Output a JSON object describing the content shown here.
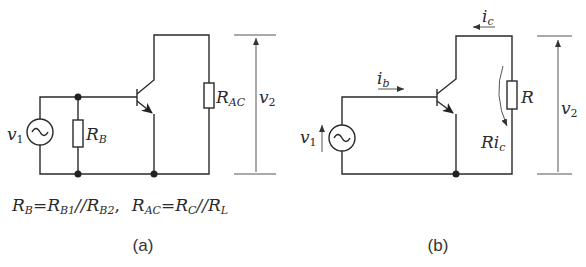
{
  "panel_a": {
    "caption": "(a)",
    "source_label": "v",
    "source_sub": "1",
    "rb_label": "R",
    "rb_sub": "B",
    "rac_label": "R",
    "rac_sub": "AC",
    "output_label": "v",
    "output_sub": "2",
    "formula": {
      "rb": "R",
      "rb_sub": "B",
      "eq1": "=",
      "rb1": "R",
      "rb1_sub": "B1",
      "par1": "//",
      "rb2": "R",
      "rb2_sub": "B2",
      "comma": ",",
      "rac": "R",
      "rac_sub": "AC",
      "eq2": "=",
      "rc": "R",
      "rc_sub": "C",
      "par2": "//",
      "rl": "R",
      "rl_sub": "L"
    }
  },
  "panel_b": {
    "caption": "(b)",
    "source_label": "v",
    "source_sub": "1",
    "ib_label": "i",
    "ib_sub": "b",
    "ic_label": "i",
    "ic_sub": "c",
    "r_label": "R",
    "ric_label": "Ri",
    "ric_sub": "c",
    "output_label": "v",
    "output_sub": "2"
  }
}
